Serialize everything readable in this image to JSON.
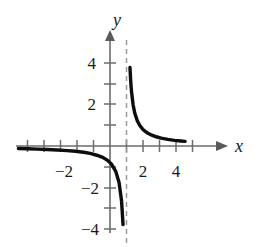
{
  "chart_data": {
    "type": "line",
    "title": "",
    "xlabel": "x",
    "ylabel": "y",
    "xlim": [
      -5.9,
      5.6
    ],
    "ylim": [
      -5.1,
      5.2
    ],
    "grid": false,
    "legend": null,
    "function": "y = 1/(x - 1)",
    "asymptotes": {
      "vertical": 1,
      "horizontal": 0,
      "vertical_style": "dashed",
      "vertical_color": "#9a9a9a"
    },
    "axis_color": "#6d6d6d",
    "curve_color": "#0d0d0d",
    "x_ticks": [
      -3,
      -2,
      -1,
      1,
      2,
      3,
      4
    ],
    "x_tick_labels": [
      {
        "value": -2,
        "label": "−2"
      },
      {
        "value": 2,
        "label": "2"
      },
      {
        "value": 4,
        "label": "4"
      }
    ],
    "y_ticks": [
      -4,
      -3,
      -2,
      -1,
      1,
      2,
      3,
      4
    ],
    "y_tick_labels": [
      {
        "value": 4,
        "label": "4"
      },
      {
        "value": 2,
        "label": "2"
      },
      {
        "value": -2,
        "label": "−2"
      },
      {
        "value": -4,
        "label": "−4"
      }
    ],
    "series": [
      {
        "name": "right-branch",
        "x": [
          1.21,
          1.25,
          1.3,
          1.4,
          1.5,
          1.65,
          1.8,
          2.0,
          2.25,
          2.5,
          2.8,
          3.1,
          3.5,
          3.9,
          4.3,
          4.55
        ],
        "y": [
          4.76,
          4.0,
          3.33,
          2.5,
          2.0,
          1.54,
          1.25,
          1.0,
          0.8,
          0.67,
          0.56,
          0.48,
          0.4,
          0.34,
          0.3,
          0.28
        ]
      },
      {
        "name": "left-branch",
        "x": [
          -5.55,
          -5.0,
          -4.4,
          -3.8,
          -3.2,
          -2.6,
          -2.1,
          -1.6,
          -1.2,
          -0.8,
          -0.45,
          -0.15,
          0.1,
          0.35,
          0.55,
          0.7,
          0.79
        ],
        "y": [
          -0.15,
          -0.17,
          -0.19,
          -0.21,
          -0.24,
          -0.28,
          -0.32,
          -0.38,
          -0.45,
          -0.56,
          -0.69,
          -0.87,
          -1.11,
          -1.54,
          -2.22,
          -3.33,
          -4.76
        ]
      }
    ]
  },
  "labels": {
    "x_axis_name": "x",
    "y_axis_name": "y"
  }
}
